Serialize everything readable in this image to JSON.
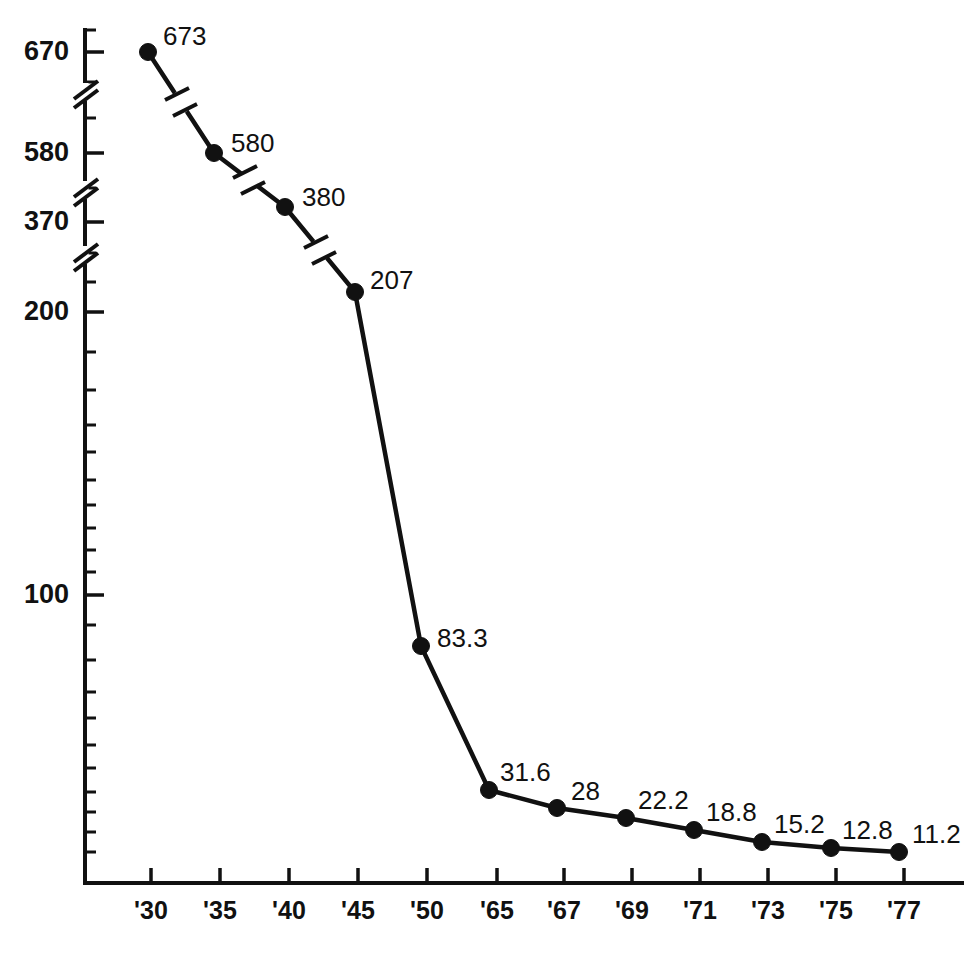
{
  "chart_data": {
    "type": "line",
    "title": "",
    "subtitle": "",
    "xlabel": "",
    "ylabel": "",
    "scale": "log-with-axis-breaks",
    "grid": false,
    "legend": null,
    "categories": [
      "'30",
      "'35",
      "'40",
      "'45",
      "'50",
      "'65",
      "'67",
      "'69",
      "'71",
      "'73",
      "'75",
      "'77"
    ],
    "values": [
      673,
      580,
      380,
      207,
      83.3,
      31.6,
      28,
      22.2,
      18.8,
      15.2,
      12.8,
      11.2
    ],
    "point_labels": [
      "673",
      "580",
      "380",
      "207",
      "83.3",
      "31.6",
      "28",
      "22.2",
      "18.8",
      "15.2",
      "12.8",
      "11.2"
    ],
    "series": [
      {
        "name": "series-1",
        "values": [
          673,
          580,
          380,
          207,
          83.3,
          31.6,
          28,
          22.2,
          18.8,
          15.2,
          12.8,
          11.2
        ]
      }
    ],
    "y_axis": {
      "tick_labels": [
        "670",
        "580",
        "370",
        "200",
        "100"
      ],
      "tick_values": [
        670,
        580,
        370,
        200,
        100
      ],
      "minor_ticks": true,
      "axis_breaks": 3
    },
    "x_axis": {
      "tick_labels": [
        "'30",
        "'35",
        "'40",
        "'45",
        "'50",
        "'65",
        "'67",
        "'69",
        "'71",
        "'73",
        "'75",
        "'77"
      ]
    },
    "line_breaks": [
      {
        "between": [
          "'30",
          "'35"
        ]
      },
      {
        "between": [
          "'35",
          "'40"
        ]
      },
      {
        "between": [
          "'40",
          "'45"
        ]
      }
    ],
    "colors": {
      "line": "#111111",
      "marker": "#111111",
      "axis": "#111111",
      "background": "#ffffff",
      "text": "#111111"
    }
  },
  "geometry": {
    "axis": {
      "x_origin": 85,
      "y_origin": 883,
      "x_end": 962,
      "y_top": 30
    },
    "y_ticks": [
      {
        "label": "670",
        "y": 52
      },
      {
        "label": "580",
        "y": 153
      },
      {
        "label": "370",
        "y": 222
      },
      {
        "label": "200",
        "y": 312
      },
      {
        "label": "100",
        "y": 595
      }
    ],
    "y_minor": [
      {
        "y": 30
      },
      {
        "y": 82
      },
      {
        "y": 118
      },
      {
        "y": 188
      },
      {
        "y": 253
      },
      {
        "y": 282
      },
      {
        "y": 352
      },
      {
        "y": 390
      },
      {
        "y": 425
      },
      {
        "y": 452
      },
      {
        "y": 480
      },
      {
        "y": 505
      },
      {
        "y": 528
      },
      {
        "y": 550
      },
      {
        "y": 572
      },
      {
        "y": 625
      },
      {
        "y": 660
      },
      {
        "y": 692
      },
      {
        "y": 718
      },
      {
        "y": 745
      },
      {
        "y": 768
      },
      {
        "y": 792
      },
      {
        "y": 812
      },
      {
        "y": 832
      },
      {
        "y": 852
      }
    ],
    "y_breaks": [
      {
        "y": 92
      },
      {
        "y": 190
      },
      {
        "y": 255
      }
    ],
    "x_ticks": [
      {
        "label": "'30",
        "x": 151
      },
      {
        "label": "'35",
        "x": 220
      },
      {
        "label": "'40",
        "x": 289
      },
      {
        "label": "'45",
        "x": 358
      },
      {
        "label": "'50",
        "x": 427
      },
      {
        "label": "'65",
        "x": 497
      },
      {
        "label": "'67",
        "x": 564
      },
      {
        "label": "'69",
        "x": 632
      },
      {
        "label": "'71",
        "x": 700
      },
      {
        "label": "'73",
        "x": 768
      },
      {
        "label": "'75",
        "x": 836
      },
      {
        "label": "'77",
        "x": 904
      }
    ],
    "points": [
      {
        "label": "673",
        "x": 148,
        "y": 52,
        "lx": 163,
        "ly": 38
      },
      {
        "label": "580",
        "x": 214,
        "y": 153,
        "lx": 231,
        "ly": 145
      },
      {
        "label": "380",
        "x": 285,
        "y": 207,
        "lx": 302,
        "ly": 199
      },
      {
        "label": "207",
        "x": 355,
        "y": 292,
        "lx": 370,
        "ly": 282
      },
      {
        "label": "83.3",
        "x": 421,
        "y": 646,
        "lx": 437,
        "ly": 640
      },
      {
        "label": "31.6",
        "x": 489,
        "y": 790,
        "lx": 500,
        "ly": 774
      },
      {
        "label": "28",
        "x": 557,
        "y": 808,
        "lx": 571,
        "ly": 793
      },
      {
        "label": "22.2",
        "x": 626,
        "y": 818,
        "lx": 638,
        "ly": 802
      },
      {
        "label": "18.8",
        "x": 694,
        "y": 830,
        "lx": 706,
        "ly": 814
      },
      {
        "label": "15.2",
        "x": 762,
        "y": 842,
        "lx": 774,
        "ly": 826
      },
      {
        "label": "12.8",
        "x": 831,
        "y": 848,
        "lx": 842,
        "ly": 832
      },
      {
        "label": "11.2",
        "x": 899,
        "y": 852,
        "lx": 912,
        "ly": 836
      }
    ],
    "line_break_marks": [
      {
        "x": 181,
        "y": 102
      },
      {
        "x": 249,
        "y": 180
      },
      {
        "x": 320,
        "y": 250
      }
    ]
  }
}
